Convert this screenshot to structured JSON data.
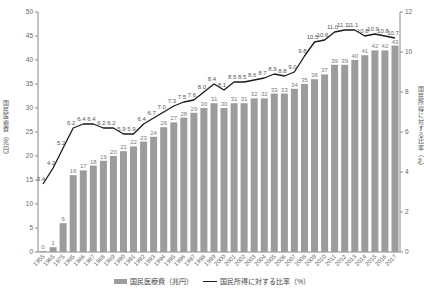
{
  "chart_data": {
    "type": "bar+line combo",
    "years": [
      "1955",
      "1965",
      "1975",
      "1985",
      "1986",
      "1987",
      "1988",
      "1989",
      "1990",
      "1991",
      "1992",
      "1993",
      "1994",
      "1995",
      "1996",
      "1997",
      "1998",
      "1999",
      "2000",
      "2001",
      "2002",
      "2003",
      "2004",
      "2005",
      "2006",
      "2007",
      "2008",
      "2009",
      "2010",
      "2011",
      "2012",
      "2013",
      "2014",
      "2015",
      "2016",
      "2017"
    ],
    "series": [
      {
        "name": "国民医療費（兆円）",
        "type": "bar",
        "axis": "left",
        "values": [
          0,
          1,
          6,
          16,
          17,
          18,
          19,
          20,
          21,
          22,
          23,
          24,
          26,
          27,
          28,
          29,
          30,
          31,
          30,
          31,
          31,
          32,
          32,
          33,
          33,
          34,
          35,
          36,
          37,
          39,
          39,
          40,
          41,
          42,
          42,
          43
        ]
      },
      {
        "name": "国民所得に対する比率（%）",
        "type": "line",
        "axis": "right",
        "values": [
          3.4,
          4.2,
          5.2,
          6.2,
          6.4,
          6.4,
          6.2,
          6.2,
          5.9,
          5.9,
          6.4,
          6.7,
          7.0,
          7.3,
          7.5,
          7.6,
          8.0,
          8.4,
          8.1,
          8.5,
          8.5,
          8.6,
          8.7,
          8.9,
          8.8,
          9.0,
          9.8,
          10.5,
          10.6,
          11.0,
          11.1,
          11.1,
          10.8,
          10.9,
          10.8,
          10.7
        ]
      }
    ],
    "title": "",
    "xlabel": "",
    "ylabel_left": "国民医療費（兆円）",
    "ylabel_right": "国民所得に対する比率（%）",
    "yaxis_left": {
      "min": 0,
      "max": 50,
      "step": 5
    },
    "yaxis_right": {
      "min": 0,
      "max": 12,
      "step": 2
    },
    "grid": "off",
    "legend_position": "bottom-center",
    "legend": [
      "国民医療費（兆円）",
      "国民所得に対する比率（%）"
    ],
    "colors": {
      "bar": "#9c9c9c",
      "line": "#1a1a1a",
      "bar_label": "#7a7a7a",
      "line_label": "#555555",
      "tick": "#666666",
      "axis": "#888888"
    }
  }
}
